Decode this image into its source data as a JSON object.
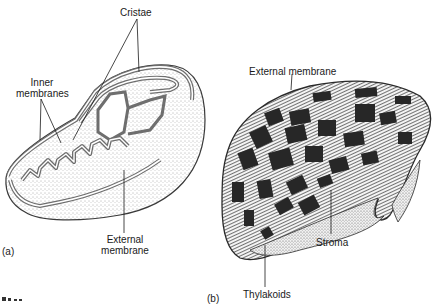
{
  "figure": {
    "panel_a": {
      "tag": "(a)",
      "subject": "mitochondrion",
      "labels": {
        "cristae": "Cristae",
        "inner_membranes_line1": "Inner",
        "inner_membranes_line2": "membranes",
        "external_membrane_line1": "External",
        "external_membrane_line2": "membrane"
      }
    },
    "panel_b": {
      "tag": "(b)",
      "subject": "chloroplast",
      "labels": {
        "external_membrane": "External membrane",
        "stroma": "Stroma",
        "thylakoids": "Thylakoids"
      }
    },
    "colors": {
      "ink": "#1a1a1a",
      "membrane_gray": "#6e6e6e",
      "stipple": "#cfcfcf",
      "background": "#ffffff"
    }
  }
}
